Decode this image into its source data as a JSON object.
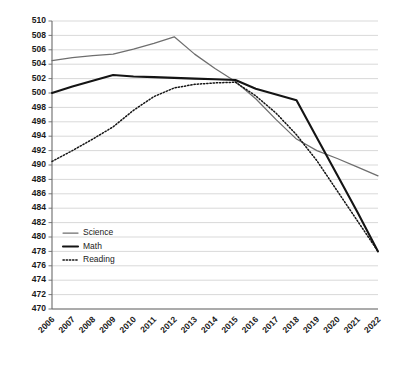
{
  "chart_data": {
    "type": "line",
    "title": "",
    "xlabel": "",
    "ylabel": "",
    "ylim": [
      470,
      510
    ],
    "ytick_step": 2,
    "grid": true,
    "legend_position": "inside-lower-left",
    "categories": [
      "2006",
      "2007",
      "2008",
      "2009",
      "2010",
      "2011",
      "2012",
      "2013",
      "2014",
      "2015",
      "2016",
      "2017",
      "2018",
      "2019",
      "2020",
      "2021",
      "2022"
    ],
    "yticks": [
      "510",
      "508",
      "506",
      "504",
      "502",
      "500",
      "498",
      "496",
      "494",
      "492",
      "490",
      "488",
      "486",
      "484",
      "482",
      "480",
      "478",
      "476",
      "474",
      "472",
      "470"
    ],
    "series": [
      {
        "name": "Science",
        "color": "#6e6e6e",
        "style": "solid-thin",
        "values": [
          504.5,
          504.9,
          505.2,
          505.4,
          506.1,
          506.9,
          507.8,
          505.4,
          503.4,
          501.6,
          499.2,
          496.3,
          493.6,
          492.0,
          490.9,
          489.7,
          488.5
        ]
      },
      {
        "name": "Math",
        "color": "#141414",
        "style": "solid-thick",
        "values": [
          500.0,
          500.9,
          501.7,
          502.5,
          502.3,
          502.2,
          502.1,
          502.0,
          501.9,
          501.8,
          500.6,
          499.8,
          499.0,
          493.8,
          488.6,
          483.4,
          478.0
        ]
      },
      {
        "name": "Reading",
        "color": "#141414",
        "style": "dotted",
        "values": [
          490.5,
          492.0,
          493.6,
          495.3,
          497.6,
          499.5,
          500.7,
          501.2,
          501.4,
          501.5,
          499.6,
          497.2,
          494.2,
          490.6,
          486.4,
          482.2,
          478.0
        ]
      }
    ]
  },
  "legend": {
    "entries": [
      {
        "label": "Science"
      },
      {
        "label": "Math"
      },
      {
        "label": "Reading"
      }
    ]
  }
}
